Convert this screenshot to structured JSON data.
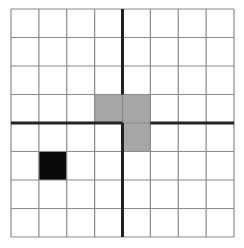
{
  "puzzle": {
    "rows": 8,
    "cols": 8,
    "colors": {
      "background": "#ffffff",
      "grid_line": "#8a8a8a",
      "thick_line": "#222222",
      "gray_cell": "#a6a6a6",
      "black_cell": "#0a0a0a"
    },
    "gray_cells": [
      [
        3,
        3
      ],
      [
        3,
        4
      ],
      [
        4,
        4
      ]
    ],
    "black_cells": [
      [
        5,
        1
      ]
    ],
    "thick_segments": [
      {
        "orientation": "v",
        "line": 4,
        "from": 0,
        "to": 3
      },
      {
        "orientation": "v",
        "line": 4,
        "from": 4,
        "to": 8
      },
      {
        "orientation": "h",
        "line": 4,
        "from": 0,
        "to": 4
      },
      {
        "orientation": "h",
        "line": 4,
        "from": 5,
        "to": 8
      }
    ]
  }
}
